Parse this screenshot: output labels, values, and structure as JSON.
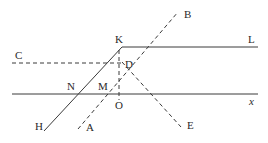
{
  "diagram": {
    "type": "geometric construction",
    "labels": {
      "K": "K",
      "L": "L",
      "B": "B",
      "C": "C",
      "D": "D",
      "N": "N",
      "M": "M",
      "O": "O",
      "x": "x",
      "H": "H",
      "A": "A",
      "E": "E"
    },
    "lines": [
      {
        "id": "x-axis",
        "style": "solid",
        "from": "left edge",
        "to": "x"
      },
      {
        "id": "KL",
        "style": "solid",
        "from": "K",
        "to": "L"
      },
      {
        "id": "CD",
        "style": "dashed",
        "from": "C",
        "to": "D"
      },
      {
        "id": "HK",
        "style": "solid",
        "from": "H",
        "to": "K",
        "through": [
          "N"
        ]
      },
      {
        "id": "AB",
        "style": "dashed",
        "from": "A",
        "to": "B",
        "through": [
          "M",
          "D"
        ]
      },
      {
        "id": "DE",
        "style": "dashed",
        "from": "D",
        "to": "E"
      },
      {
        "id": "KO",
        "style": "dashed",
        "from": "K",
        "to": "O"
      }
    ],
    "stroke_color": "#3a3a3a",
    "background": "#ffffff"
  }
}
